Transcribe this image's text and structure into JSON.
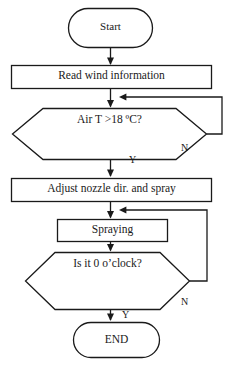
{
  "diagram": {
    "stroke_color": "#1a1a1a",
    "fill_color": "#ffffff",
    "background": "#ffffff",
    "nodes": [
      {
        "id": "start",
        "shape": "terminator",
        "label": "Start"
      },
      {
        "id": "read",
        "shape": "process",
        "label": "Read wind information"
      },
      {
        "id": "airt",
        "shape": "decision",
        "label": "Air T >18 ºC?"
      },
      {
        "id": "adjust",
        "shape": "process",
        "label": "Adjust nozzle dir. and spray"
      },
      {
        "id": "spray",
        "shape": "process",
        "label": "Spraying"
      },
      {
        "id": "oclock",
        "shape": "decision",
        "label": "Is it 0 o’clock?"
      },
      {
        "id": "end",
        "shape": "terminator",
        "label": "END"
      }
    ],
    "edges": [
      {
        "from": "start",
        "to": "read",
        "label": ""
      },
      {
        "from": "read",
        "to": "airt",
        "label": ""
      },
      {
        "from": "airt",
        "to": "adjust",
        "label": "Y"
      },
      {
        "from": "airt",
        "to": "airt",
        "label": "N"
      },
      {
        "from": "adjust",
        "to": "spray",
        "label": ""
      },
      {
        "from": "spray",
        "to": "oclock",
        "label": ""
      },
      {
        "from": "oclock",
        "to": "end",
        "label": "Y"
      },
      {
        "from": "oclock",
        "to": "spray",
        "label": "N"
      }
    ],
    "branch_labels": {
      "airt_yes": "Y",
      "airt_no": "N",
      "oclock_yes": "Y",
      "oclock_no": "N"
    }
  }
}
